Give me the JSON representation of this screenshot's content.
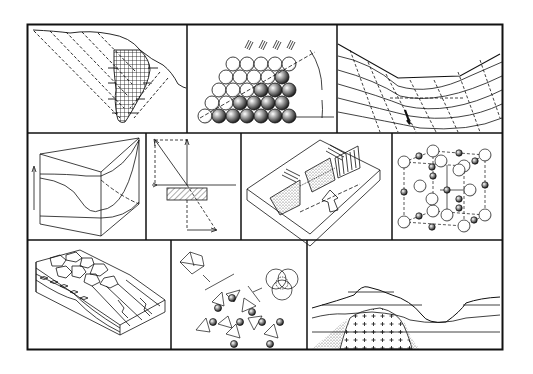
{
  "figure": {
    "type": "illustration-collage",
    "rows": 3,
    "colors": {
      "ink": "#111111",
      "paper": "#ffffff",
      "stipple": "#444444"
    },
    "panels": [
      {
        "id": "slope-ore-body",
        "row": 1,
        "col": 1,
        "depicts": "cross-section of hillside with dashed inclined strata and cross-hatched vertical body"
      },
      {
        "id": "sphere-packing-pile",
        "row": 1,
        "col": 2,
        "depicts": "stacked spheres (light and shaded) forming slope with angle arc and falling hatch marks"
      },
      {
        "id": "valley-strata-section",
        "row": 1,
        "col": 3,
        "depicts": "valley cross-section with curved strata, dashed lines, small arrows and upward arrow"
      },
      {
        "id": "block-diagram-surface",
        "row": 2,
        "col": 1,
        "depicts": "3D block with curved surface and vertical arrow"
      },
      {
        "id": "vector-stress-diagram",
        "row": 2,
        "col": 2,
        "depicts": "vector arrows with dashed components and hatched rectangular block"
      },
      {
        "id": "sediment-channel-block",
        "row": 2,
        "col": 3,
        "depicts": "isometric slab with stippled deposits, striped wall, hatch marks and hollow arrow"
      },
      {
        "id": "crystal-lattice",
        "row": 2,
        "col": 4,
        "depicts": "cubic crystal lattice of large and small spheres with dashed edges"
      },
      {
        "id": "polygonal-terrain-block",
        "row": 3,
        "col": 1,
        "depicts": "block diagram with polygonal cracked surface, layered strata and ridges"
      },
      {
        "id": "tetrahedra-silicate-ring",
        "row": 3,
        "col": 2,
        "depicts": "ring of tetrahedra with spheres, inset octahedron and overlapping circles"
      },
      {
        "id": "intrusion-landscape",
        "row": 3,
        "col": 3,
        "depicts": "landscape profile with horizontal strata and plus-pattern intrusive body with stippled margin"
      }
    ]
  }
}
